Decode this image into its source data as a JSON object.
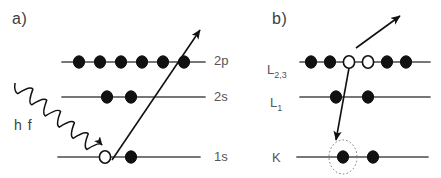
{
  "figure": {
    "width": 441,
    "height": 178,
    "background": "#ffffff",
    "line_color": "#4a4a4a",
    "marker_fill": "#111111",
    "marker_stroke": "#111111",
    "hole_fill": "#ffffff",
    "label_color": "#555555",
    "panel_label_color": "#3d3d3d"
  },
  "panels": [
    {
      "id": "panel-a",
      "label": "a)",
      "label_pos": {
        "x": 12,
        "y": 10
      },
      "description": "photoionization",
      "label_side": "right",
      "levels": [
        {
          "name": "2p",
          "label": "2p",
          "label_pos": {
            "x": 214,
            "y": 53
          },
          "line": {
            "x1": 62,
            "x2": 205,
            "y": 62
          },
          "occupancy": [
            {
              "state": "filled",
              "cx": 79
            },
            {
              "state": "filled",
              "cx": 100
            },
            {
              "state": "filled",
              "cx": 121
            },
            {
              "state": "filled",
              "cx": 142
            },
            {
              "state": "filled",
              "cx": 163
            },
            {
              "state": "filled",
              "cx": 184
            }
          ]
        },
        {
          "name": "2s",
          "label": "2s",
          "label_pos": {
            "x": 214,
            "y": 89
          },
          "line": {
            "x1": 62,
            "x2": 205,
            "y": 97
          },
          "occupancy": [
            {
              "state": "filled",
              "cx": 107
            },
            {
              "state": "filled",
              "cx": 131
            }
          ]
        },
        {
          "name": "1s",
          "label": "1s",
          "label_pos": {
            "x": 214,
            "y": 149
          },
          "line": {
            "x1": 58,
            "x2": 200,
            "y": 157
          },
          "occupancy": [
            {
              "state": "hole",
              "cx": 105
            },
            {
              "state": "filled",
              "cx": 131
            }
          ]
        }
      ],
      "annotations": [
        {
          "kind": "wavy-arrow",
          "name": "incident-photon-arrow",
          "label": "h f",
          "label_pos": {
            "x": 14,
            "y": 117
          },
          "from": {
            "x": 15,
            "y": 83
          },
          "to": {
            "x": 98,
            "y": 150
          }
        },
        {
          "kind": "straight-arrow",
          "name": "photoelectron-arrow",
          "from": {
            "x": 112,
            "y": 160
          },
          "to": {
            "x": 200,
            "y": 30
          }
        }
      ]
    },
    {
      "id": "panel-b",
      "label": "b)",
      "label_pos": {
        "x": 272,
        "y": 10
      },
      "description": "auger decay",
      "label_side": "left",
      "levels": [
        {
          "name": "L23",
          "label": "L",
          "label_sub": "2,3",
          "label_pos": {
            "x": 267,
            "y": 62
          },
          "line": {
            "x1": 300,
            "x2": 430,
            "y": 62
          },
          "occupancy": [
            {
              "state": "filled",
              "cx": 311
            },
            {
              "state": "filled",
              "cx": 330
            },
            {
              "state": "hole",
              "cx": 349
            },
            {
              "state": "hole",
              "cx": 368
            },
            {
              "state": "filled",
              "cx": 387
            },
            {
              "state": "filled",
              "cx": 406
            }
          ]
        },
        {
          "name": "L1",
          "label": "L",
          "label_sub": "1",
          "label_pos": {
            "x": 270,
            "y": 95
          },
          "line": {
            "x1": 300,
            "x2": 430,
            "y": 97
          },
          "occupancy": [
            {
              "state": "filled",
              "cx": 336
            },
            {
              "state": "filled",
              "cx": 368
            }
          ]
        },
        {
          "name": "K",
          "label": "K",
          "label_sub": "",
          "label_pos": {
            "x": 272,
            "y": 150
          },
          "line": {
            "x1": 297,
            "x2": 428,
            "y": 157
          },
          "occupancy": [
            {
              "state": "filled",
              "cx": 343,
              "highlight": true
            },
            {
              "state": "filled",
              "cx": 373
            }
          ]
        }
      ],
      "annotations": [
        {
          "kind": "straight-arrow",
          "name": "auger-electron-arrow",
          "from": {
            "x": 356,
            "y": 48
          },
          "to": {
            "x": 400,
            "y": 16
          }
        },
        {
          "kind": "straight-arrow",
          "name": "core-hole-filling-arrow",
          "from": {
            "x": 349,
            "y": 68
          },
          "to": {
            "x": 336,
            "y": 140
          }
        },
        {
          "kind": "dotted-ellipse",
          "name": "core-hole-highlight",
          "cx": 343,
          "cy": 157,
          "rx": 14,
          "ry": 17
        }
      ]
    }
  ]
}
